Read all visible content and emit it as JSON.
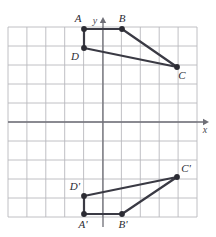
{
  "figure": {
    "kind": "coordinate-grid-translation",
    "background_color": "#ffffff",
    "grid": {
      "line_color": "#b9b9bd",
      "columns": 10,
      "rows": 10,
      "cell_size_px": 18.9,
      "left_px": 8,
      "top_px": 27,
      "right_px": 197,
      "bottom_px": 217
    },
    "axes": {
      "color": "#6e6e76",
      "x_axis_label": "x",
      "y_axis_label": "y",
      "x_axis_y_px": 122,
      "y_axis_x_px": 103,
      "x_axis_start_px": 8,
      "x_axis_end_px": 209,
      "y_axis_start_px": 227,
      "y_axis_end_px": 17
    },
    "stroke_color": "#3a3a44",
    "vertex_color": "#2b2b33"
  },
  "chart_data": {
    "type": "scatter",
    "title": "",
    "xlabel": "x",
    "ylabel": "y",
    "grid": true,
    "legend": "none",
    "xlim": [
      -5,
      5
    ],
    "ylim": [
      -5,
      5
    ],
    "shapes": [
      {
        "name": "quadrilateral-ABCD",
        "closed": true,
        "vertices": [
          {
            "label": "A",
            "px": 84,
            "py": 29,
            "x": -1,
            "y": 5,
            "label_px": 78,
            "label_py": 22,
            "label_anchor": "middle"
          },
          {
            "label": "B",
            "px": 122,
            "py": 29,
            "x": 1,
            "y": 5,
            "label_px": 122,
            "label_py": 22,
            "label_anchor": "middle"
          },
          {
            "label": "C",
            "px": 177,
            "py": 67,
            "x": 4,
            "y": 3,
            "label_px": 182,
            "label_py": 79,
            "label_anchor": "middle"
          },
          {
            "label": "D",
            "px": 84,
            "py": 48,
            "x": -1,
            "y": 4,
            "label_px": 75,
            "label_py": 60,
            "label_anchor": "middle"
          }
        ]
      },
      {
        "name": "quadrilateral-A-prime-B-prime-C-prime-D-prime",
        "closed": true,
        "vertices": [
          {
            "label": "A'",
            "px": 84,
            "py": 214,
            "x": -1,
            "y": -5,
            "label_px": 83,
            "label_py": 228,
            "label_anchor": "middle"
          },
          {
            "label": "B'",
            "px": 122,
            "py": 214,
            "x": 1,
            "y": -5,
            "label_px": 123,
            "label_py": 228,
            "label_anchor": "middle"
          },
          {
            "label": "C'",
            "px": 177,
            "py": 177,
            "x": 4,
            "y": -3,
            "label_px": 186,
            "label_py": 172,
            "label_anchor": "middle"
          },
          {
            "label": "D'",
            "px": 84,
            "py": 196,
            "x": -1,
            "y": -4,
            "label_px": 75,
            "label_py": 190,
            "label_anchor": "middle"
          }
        ]
      }
    ]
  }
}
